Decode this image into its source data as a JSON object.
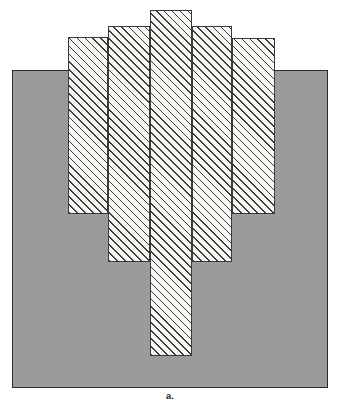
{
  "figure": {
    "caption": "a.",
    "caption_position": {
      "x": 0,
      "y": 391
    },
    "canvas": {
      "width": 340,
      "height": 405,
      "background": "#ffffff"
    },
    "base_block": {
      "name": "gray-base-block",
      "x": 12,
      "y": 70,
      "width": 316,
      "height": 318,
      "fill": "#9b9b9b",
      "stroke": "#2b2b2b"
    },
    "bars_style": {
      "fill": "#f7f7f4",
      "stroke": "#3a3a3a",
      "hatch_angle_deg": 45,
      "hatch_direction": "bottom-left-to-top-right"
    },
    "bars": [
      {
        "label": "bar-1",
        "x": 68,
        "y": 37,
        "width": 40,
        "height": 177
      },
      {
        "label": "bar-2",
        "x": 108,
        "y": 26,
        "width": 42,
        "height": 236
      },
      {
        "label": "bar-3",
        "x": 150,
        "y": 10,
        "width": 42,
        "height": 346
      },
      {
        "label": "bar-4",
        "x": 192,
        "y": 26,
        "width": 40,
        "height": 236
      },
      {
        "label": "bar-5",
        "x": 232,
        "y": 38,
        "width": 43,
        "height": 176
      }
    ]
  },
  "chart_data": {
    "type": "bar",
    "title": "a.",
    "xlabel": "",
    "ylabel": "",
    "categories": [
      "bar-1",
      "bar-2",
      "bar-3",
      "bar-4",
      "bar-5"
    ],
    "values": [
      177,
      236,
      346,
      236,
      176
    ],
    "bar_tops_px": [
      37,
      26,
      10,
      26,
      38
    ],
    "bar_bottoms_px": [
      214,
      262,
      356,
      262,
      214
    ],
    "bar_left_px": [
      68,
      108,
      150,
      192,
      232
    ],
    "bar_right_px": [
      108,
      150,
      192,
      232,
      275
    ],
    "baseline_top_px": 70,
    "baseline_bottom_px": 388,
    "grid": false,
    "legend": false,
    "annotations": [
      "a."
    ]
  }
}
